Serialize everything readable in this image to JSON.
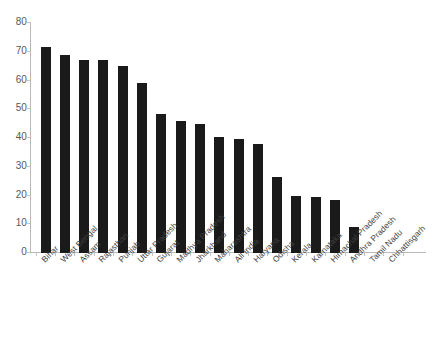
{
  "chart_data": {
    "type": "bar",
    "title": "",
    "subtitle": "",
    "xlabel": "",
    "ylabel": "",
    "ylim": [
      0,
      80
    ],
    "yticks": [
      0,
      10,
      20,
      30,
      40,
      50,
      60,
      70,
      80
    ],
    "ytick_labels": [
      "0",
      "10",
      "20",
      "30",
      "40",
      "50",
      "60",
      "70",
      "80"
    ],
    "grid": false,
    "legend": null,
    "bar_color": "#1a1a1a",
    "axis_color": "#b9b9b9",
    "categories": [
      "Bihar",
      "West Bengal",
      "Assam",
      "Rajasthan",
      "Punjab",
      "Uttar Pradesh",
      "Gujarat",
      "Madhya Pradesh",
      "Jharkhand",
      "Maharashtra",
      "All India",
      "Haryana",
      "Odisha",
      "Kerala",
      "Karnataka",
      "Himachal Pradesh",
      "Andhra Pradesh",
      "Tamil Nadu",
      "Chhattisgarh"
    ],
    "values": [
      71.5,
      69,
      67,
      67,
      65,
      59,
      48.5,
      46,
      45,
      40.5,
      39.5,
      38,
      26.5,
      20,
      19.5,
      18.5,
      9,
      0,
      0
    ]
  }
}
